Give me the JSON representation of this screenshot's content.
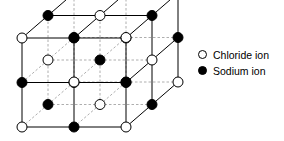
{
  "figure": {
    "background_color": "#ffffff",
    "line_color": "#000000",
    "hidden_line_color": "#999999"
  },
  "legend": {
    "items": [
      {
        "marker": "open-circle",
        "label": "Chloride ion",
        "fill": "#ffffff",
        "stroke": "#000000"
      },
      {
        "marker": "filled-circle",
        "label": "Sodium ion",
        "fill": "#000000",
        "stroke": "#000000"
      }
    ]
  },
  "lattice": {
    "description": "3 x 3 x 3 alternating rock-salt lattice drawn in oblique projection",
    "projection": {
      "step_x": 52,
      "step_y": 44.5,
      "depth_dx": 26,
      "depth_dy": -22.5
    },
    "origin": {
      "x": 22,
      "y": 127
    },
    "grid_size": 3,
    "ion_radius": 5,
    "ions": [
      {
        "i": 0,
        "j": 0,
        "k": 0,
        "type": "chloride",
        "cx": 22,
        "cy": 127
      },
      {
        "i": 1,
        "j": 0,
        "k": 0,
        "type": "sodium",
        "cx": 74,
        "cy": 127
      },
      {
        "i": 2,
        "j": 0,
        "k": 0,
        "type": "chloride",
        "cx": 126,
        "cy": 127
      },
      {
        "i": 0,
        "j": 1,
        "k": 0,
        "type": "sodium",
        "cx": 22,
        "cy": 82.5
      },
      {
        "i": 1,
        "j": 1,
        "k": 0,
        "type": "chloride",
        "cx": 74,
        "cy": 82.5
      },
      {
        "i": 2,
        "j": 1,
        "k": 0,
        "type": "sodium",
        "cx": 126,
        "cy": 82.5
      },
      {
        "i": 0,
        "j": 2,
        "k": 0,
        "type": "chloride",
        "cx": 22,
        "cy": 38
      },
      {
        "i": 1,
        "j": 2,
        "k": 0,
        "type": "sodium",
        "cx": 74,
        "cy": 38
      },
      {
        "i": 2,
        "j": 2,
        "k": 0,
        "type": "chloride",
        "cx": 126,
        "cy": 38
      },
      {
        "i": 0,
        "j": 0,
        "k": 1,
        "type": "sodium",
        "cx": 48,
        "cy": 104.5
      },
      {
        "i": 1,
        "j": 0,
        "k": 1,
        "type": "chloride",
        "cx": 100,
        "cy": 104.5
      },
      {
        "i": 2,
        "j": 0,
        "k": 1,
        "type": "sodium",
        "cx": 152,
        "cy": 104.5
      },
      {
        "i": 0,
        "j": 1,
        "k": 1,
        "type": "chloride",
        "cx": 48,
        "cy": 60
      },
      {
        "i": 1,
        "j": 1,
        "k": 1,
        "type": "sodium",
        "cx": 100,
        "cy": 60
      },
      {
        "i": 2,
        "j": 1,
        "k": 1,
        "type": "chloride",
        "cx": 152,
        "cy": 60
      },
      {
        "i": 0,
        "j": 2,
        "k": 1,
        "type": "sodium",
        "cx": 48,
        "cy": 15.5
      },
      {
        "i": 1,
        "j": 2,
        "k": 1,
        "type": "chloride",
        "cx": 100,
        "cy": 15.5
      },
      {
        "i": 2,
        "j": 2,
        "k": 1,
        "type": "sodium",
        "cx": 152,
        "cy": 15.5
      },
      {
        "i": 0,
        "j": 0,
        "k": 2,
        "type": "chloride",
        "cx": 74,
        "cy": 82
      },
      {
        "i": 1,
        "j": 0,
        "k": 2,
        "type": "sodium",
        "cx": 126,
        "cy": 82
      },
      {
        "i": 2,
        "j": 0,
        "k": 2,
        "type": "chloride",
        "cx": 178,
        "cy": 82
      },
      {
        "i": 0,
        "j": 1,
        "k": 2,
        "type": "sodium",
        "cx": 74,
        "cy": 37.5
      },
      {
        "i": 1,
        "j": 1,
        "k": 2,
        "type": "chloride",
        "cx": 126,
        "cy": 37.5
      },
      {
        "i": 2,
        "j": 1,
        "k": 2,
        "type": "sodium",
        "cx": 178,
        "cy": 37.5
      },
      {
        "i": 0,
        "j": 2,
        "k": 2,
        "type": "chloride",
        "cx": 74,
        "cy": -7
      },
      {
        "i": 1,
        "j": 2,
        "k": 2,
        "type": "sodium",
        "cx": 126,
        "cy": -7
      },
      {
        "i": 2,
        "j": 2,
        "k": 2,
        "type": "chloride",
        "cx": 178,
        "cy": -7
      }
    ]
  }
}
